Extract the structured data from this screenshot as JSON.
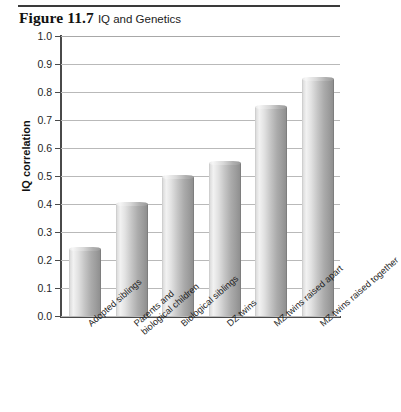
{
  "figure": {
    "number": "Figure 11.7",
    "caption": "IQ and Genetics"
  },
  "chart_data": {
    "type": "bar",
    "title": "IQ and Genetics",
    "xlabel": "",
    "ylabel": "IQ correlation",
    "ylim": [
      0.0,
      1.0
    ],
    "grid": true,
    "legend": "none",
    "categories": [
      "Adopted siblings",
      "Parents and biological children",
      "Biological siblings",
      "DZ twins",
      "MZ twins raised apart",
      "MZ twins raised together"
    ],
    "category_lines": [
      [
        "Adopted siblings"
      ],
      [
        "Parents and",
        "biological children"
      ],
      [
        "Biological siblings"
      ],
      [
        "DZ twins"
      ],
      [
        "MZ twins raised apart"
      ],
      [
        "MZ twins raised together"
      ]
    ],
    "values": [
      0.24,
      0.4,
      0.495,
      0.545,
      0.745,
      0.845
    ],
    "ytick_labels": [
      "1.0",
      "0.9",
      "0.8",
      "0.7",
      "0.6",
      "0.5",
      "0.4",
      "0.3",
      "0.2",
      "0.1",
      "0.0"
    ],
    "ytick_values": [
      1.0,
      0.9,
      0.8,
      0.7,
      0.6,
      0.5,
      0.4,
      0.3,
      0.2,
      0.1,
      0.0
    ],
    "colors": {
      "bar_light": "#f2f2f2",
      "bar_dark": "#8f8f8f",
      "gridline": "#b9b9b9",
      "axis": "#4a4a4a",
      "background": "#ffffff"
    }
  }
}
